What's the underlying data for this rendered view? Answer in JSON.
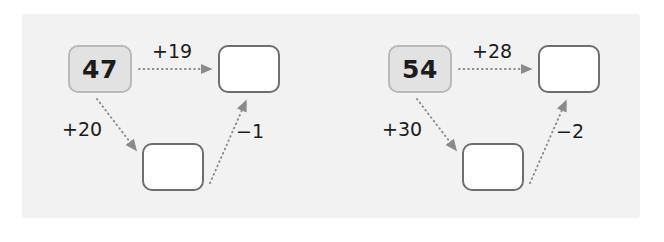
{
  "worksheet": {
    "title": "Number bridging diagrams",
    "panel_color": "#f2f2f2",
    "background_color": "#ffffff",
    "start_box_fill": "#e2e2e2",
    "start_box_border": "#b9b9b9",
    "answer_box_fill": "#ffffff",
    "answer_box_border": "#6e6e6e",
    "arrow_color": "#8a8a8a",
    "text_color": "#1c1c1c"
  },
  "diagrams": [
    {
      "id": "diagram-left",
      "start_value": "47",
      "direct_label": "+19",
      "direct_arrow": "dotted-arrow-right",
      "down_label": "+20",
      "down_arrow": "dotted-arrow-down-right",
      "up_label": "−1",
      "up_arrow": "dotted-arrow-up-right",
      "middle_value": "",
      "result_value": ""
    },
    {
      "id": "diagram-right",
      "start_value": "54",
      "direct_label": "+28",
      "direct_arrow": "dotted-arrow-right",
      "down_label": "+30",
      "down_arrow": "dotted-arrow-down-right",
      "up_label": "−2",
      "up_arrow": "dotted-arrow-up-right",
      "middle_value": "",
      "result_value": ""
    }
  ]
}
